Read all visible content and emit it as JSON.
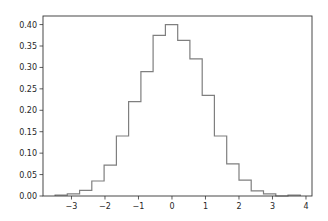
{
  "chart_data": {
    "type": "bar",
    "subtype": "step-histogram",
    "title": "",
    "xlabel": "",
    "ylabel": "",
    "xlim": [
      -3.85,
      4.18
    ],
    "ylim": [
      0.0,
      0.42
    ],
    "grid": false,
    "legend": null,
    "line_color": "#7f7f7f",
    "x_ticks": [
      -3,
      -2,
      -1,
      0,
      1,
      2,
      3,
      4
    ],
    "x_tick_labels": [
      "−3",
      "−2",
      "−1",
      "0",
      "1",
      "2",
      "3",
      "4"
    ],
    "y_ticks": [
      0.0,
      0.05,
      0.1,
      0.15,
      0.2,
      0.25,
      0.3,
      0.35,
      0.4
    ],
    "y_tick_labels": [
      "0.00",
      "0.05",
      "0.10",
      "0.15",
      "0.20",
      "0.25",
      "0.30",
      "0.35",
      "0.40"
    ],
    "bin_edges": [
      -3.49,
      -3.124,
      -2.758,
      -2.392,
      -2.026,
      -1.66,
      -1.294,
      -0.928,
      -0.562,
      -0.196,
      0.17,
      0.536,
      0.902,
      1.268,
      1.634,
      2.0,
      2.366,
      2.732,
      3.098,
      3.464,
      3.83
    ],
    "values": [
      0.002,
      0.005,
      0.013,
      0.035,
      0.072,
      0.14,
      0.22,
      0.29,
      0.375,
      0.4,
      0.363,
      0.32,
      0.235,
      0.14,
      0.075,
      0.037,
      0.012,
      0.005,
      0.0,
      0.002
    ]
  }
}
